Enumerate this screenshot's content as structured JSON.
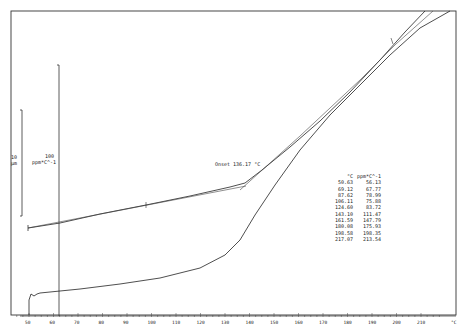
{
  "chart_data": {
    "type": "line",
    "title": "",
    "xlabel": "°C",
    "ylabel": "",
    "x_ticks": [
      50,
      60,
      70,
      80,
      90,
      100,
      110,
      120,
      130,
      140,
      150,
      160,
      170,
      180,
      190,
      200,
      210
    ],
    "xlim": [
      43,
      220
    ],
    "grid": false,
    "scale_bars": [
      {
        "label_value": "10",
        "label_unit": "µm"
      },
      {
        "label_value": "100",
        "label_unit": "ppm*C^-1"
      }
    ],
    "annotation": "Onset 136.17 °C",
    "series": [
      {
        "name": "dimension change (µm)",
        "x": [
          50,
          60,
          70,
          80,
          90,
          100,
          110,
          120,
          130,
          136,
          140,
          150,
          160,
          170,
          180,
          190,
          200,
          210
        ],
        "y_px": [
          228,
          224,
          220,
          216,
          212,
          208,
          203,
          197,
          190,
          185,
          178,
          162,
          143,
          122,
          98,
          72,
          44,
          11
        ]
      },
      {
        "name": "CTE (ppm/°C)",
        "x": [
          50,
          51,
          53,
          55,
          60,
          70,
          80,
          90,
          100,
          110,
          120,
          130,
          140,
          150,
          160,
          170,
          180,
          190,
          200,
          210,
          215
        ],
        "y_px": [
          315,
          300,
          294,
          296,
          294,
          291,
          287,
          283,
          278,
          272,
          262,
          245,
          215,
          165,
          125,
          100,
          78,
          55,
          35,
          18,
          11
        ]
      }
    ],
    "table": {
      "headers": [
        "°C",
        "ppm*C^-1"
      ],
      "rows": [
        [
          "50.63",
          "56.13"
        ],
        [
          "69.12",
          "67.77"
        ],
        [
          "87.62",
          "78.99"
        ],
        [
          "106.11",
          "75.88"
        ],
        [
          "124.60",
          "83.72"
        ],
        [
          "143.10",
          "111.47"
        ],
        [
          "161.59",
          "147.79"
        ],
        [
          "180.08",
          "175.93"
        ],
        [
          "198.58",
          "198.35"
        ],
        [
          "217.07",
          "213.54"
        ]
      ]
    }
  },
  "labels": {
    "scale_small_value": "10",
    "scale_small_unit": "µm",
    "scale_big_value": "100",
    "scale_big_unit": "ppm*C^-1",
    "onset": "Onset 136.17 °C",
    "x_unit": "°C"
  }
}
